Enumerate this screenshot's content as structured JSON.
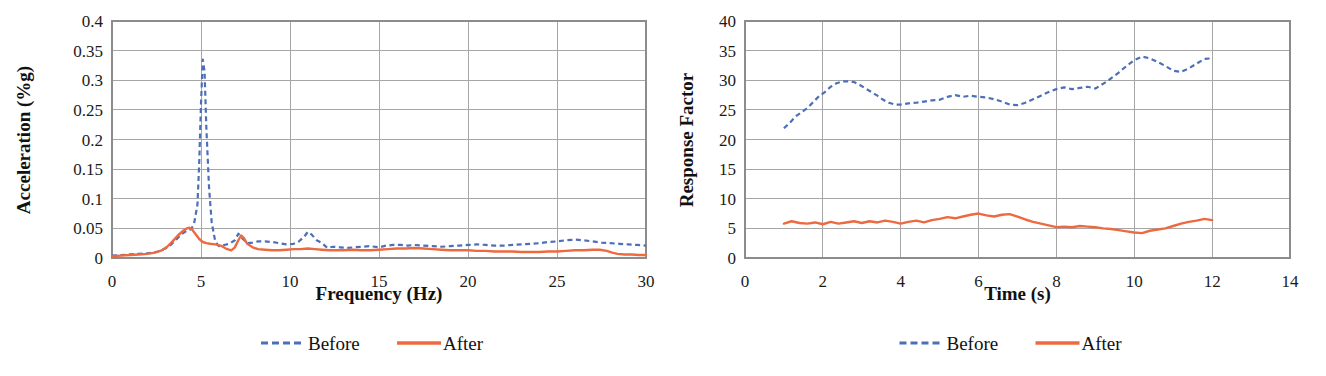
{
  "figure": {
    "panels": [
      "left",
      "right"
    ],
    "background": "#ffffff",
    "legend_common": {
      "before_label": "Before",
      "after_label": "After",
      "before_color": "#4d6fb8",
      "after_color": "#ed6a41",
      "before_style": "dashed",
      "after_style": "solid"
    }
  },
  "chart_data": [
    {
      "id": "left",
      "type": "line",
      "title": "",
      "xlabel": "Frequency (Hz)",
      "ylabel": "Acceleration (%g)",
      "xlim": [
        0,
        30
      ],
      "ylim": [
        0,
        0.4
      ],
      "xticks": [
        0,
        5,
        10,
        15,
        20,
        25,
        30
      ],
      "xtick_labels": [
        "0",
        "5",
        "10",
        "15",
        "20",
        "25",
        "30"
      ],
      "yticks": [
        0,
        0.05,
        0.1,
        0.15,
        0.2,
        0.25,
        0.3,
        0.35,
        0.4
      ],
      "ytick_labels": [
        "0",
        "0.05",
        "0.1",
        "0.15",
        "0.2",
        "0.25",
        "0.3",
        "0.35",
        "0.4"
      ],
      "grid": "horizontal-and-vertical",
      "legend_position": "below",
      "series": [
        {
          "name": "Before",
          "color": "#4d6fb8",
          "style": "dashed",
          "x": [
            0.0,
            0.5,
            1.0,
            1.5,
            2.0,
            2.3,
            2.6,
            3.0,
            3.3,
            3.6,
            3.9,
            4.2,
            4.4,
            4.6,
            4.8,
            4.9,
            5.0,
            5.1,
            5.2,
            5.3,
            5.45,
            5.6,
            5.8,
            6.0,
            6.3,
            6.6,
            6.9,
            7.1,
            7.3,
            7.6,
            7.9,
            8.2,
            8.6,
            9.0,
            9.4,
            9.8,
            10.2,
            10.5,
            10.8,
            11.0,
            11.2,
            11.5,
            11.8,
            12.1,
            12.4,
            12.8,
            13.2,
            13.6,
            14.0,
            14.5,
            15.0,
            15.4,
            15.8,
            16.2,
            16.6,
            17.0,
            17.5,
            18.0,
            18.5,
            19.0,
            19.5,
            20.0,
            20.5,
            21.0,
            21.5,
            22.0,
            22.5,
            23.0,
            23.5,
            24.0,
            24.5,
            25.0,
            25.5,
            26.0,
            26.5,
            27.0,
            27.5,
            28.0,
            28.5,
            29.0,
            29.5,
            30.0
          ],
          "y": [
            0.004,
            0.005,
            0.006,
            0.007,
            0.008,
            0.009,
            0.011,
            0.016,
            0.022,
            0.031,
            0.04,
            0.046,
            0.048,
            0.056,
            0.09,
            0.16,
            0.26,
            0.335,
            0.315,
            0.22,
            0.12,
            0.06,
            0.028,
            0.02,
            0.022,
            0.024,
            0.03,
            0.041,
            0.034,
            0.025,
            0.026,
            0.028,
            0.028,
            0.027,
            0.025,
            0.023,
            0.024,
            0.028,
            0.036,
            0.044,
            0.04,
            0.03,
            0.025,
            0.017,
            0.019,
            0.018,
            0.017,
            0.018,
            0.019,
            0.02,
            0.018,
            0.021,
            0.022,
            0.022,
            0.021,
            0.022,
            0.021,
            0.02,
            0.019,
            0.02,
            0.021,
            0.022,
            0.023,
            0.022,
            0.021,
            0.021,
            0.022,
            0.023,
            0.024,
            0.025,
            0.027,
            0.028,
            0.03,
            0.031,
            0.03,
            0.028,
            0.026,
            0.025,
            0.024,
            0.023,
            0.022,
            0.021
          ]
        },
        {
          "name": "After",
          "color": "#ed6a41",
          "style": "solid",
          "x": [
            0.0,
            0.5,
            1.0,
            1.5,
            2.0,
            2.4,
            2.8,
            3.1,
            3.4,
            3.7,
            4.0,
            4.2,
            4.35,
            4.5,
            4.7,
            4.9,
            5.1,
            5.3,
            5.5,
            5.8,
            6.1,
            6.4,
            6.7,
            6.9,
            7.1,
            7.25,
            7.4,
            7.6,
            7.9,
            8.2,
            8.6,
            9.0,
            9.4,
            9.8,
            10.2,
            10.6,
            11.0,
            11.4,
            11.8,
            12.2,
            12.6,
            13.0,
            13.5,
            14.0,
            14.5,
            15.0,
            15.5,
            16.0,
            16.5,
            17.0,
            17.5,
            18.0,
            18.5,
            19.0,
            19.5,
            20.0,
            20.5,
            21.0,
            21.5,
            22.0,
            22.5,
            23.0,
            23.5,
            24.0,
            24.5,
            25.0,
            25.5,
            26.0,
            26.5,
            27.0,
            27.4,
            27.8,
            28.1,
            28.4,
            28.8,
            29.2,
            29.6,
            30.0
          ],
          "y": [
            0.003,
            0.004,
            0.005,
            0.006,
            0.007,
            0.009,
            0.013,
            0.019,
            0.028,
            0.038,
            0.046,
            0.05,
            0.051,
            0.048,
            0.04,
            0.032,
            0.027,
            0.025,
            0.024,
            0.023,
            0.021,
            0.016,
            0.013,
            0.018,
            0.03,
            0.038,
            0.034,
            0.024,
            0.018,
            0.015,
            0.014,
            0.013,
            0.013,
            0.014,
            0.015,
            0.015,
            0.016,
            0.015,
            0.014,
            0.013,
            0.013,
            0.013,
            0.014,
            0.013,
            0.013,
            0.014,
            0.015,
            0.016,
            0.016,
            0.017,
            0.016,
            0.015,
            0.014,
            0.013,
            0.013,
            0.013,
            0.012,
            0.012,
            0.011,
            0.011,
            0.011,
            0.01,
            0.01,
            0.01,
            0.011,
            0.011,
            0.012,
            0.013,
            0.013,
            0.014,
            0.014,
            0.012,
            0.009,
            0.007,
            0.006,
            0.006,
            0.005,
            0.005
          ]
        }
      ]
    },
    {
      "id": "right",
      "type": "line",
      "title": "",
      "xlabel": "Time (s)",
      "ylabel": "Response Factor",
      "xlim": [
        0,
        14
      ],
      "ylim": [
        0,
        40
      ],
      "xticks": [
        0,
        2,
        4,
        6,
        8,
        10,
        12,
        14
      ],
      "xtick_labels": [
        "0",
        "2",
        "4",
        "6",
        "8",
        "10",
        "12",
        "14"
      ],
      "yticks": [
        0,
        5,
        10,
        15,
        20,
        25,
        30,
        35,
        40
      ],
      "ytick_labels": [
        "0",
        "5",
        "10",
        "15",
        "20",
        "25",
        "30",
        "35",
        "40"
      ],
      "grid": "horizontal-and-vertical",
      "legend_position": "below",
      "series": [
        {
          "name": "Before",
          "color": "#4d6fb8",
          "style": "dashed",
          "x": [
            1.0,
            1.15,
            1.3,
            1.45,
            1.6,
            1.75,
            1.9,
            2.05,
            2.2,
            2.35,
            2.5,
            2.65,
            2.8,
            2.95,
            3.1,
            3.25,
            3.4,
            3.55,
            3.7,
            3.85,
            4.0,
            4.2,
            4.4,
            4.6,
            4.8,
            5.0,
            5.2,
            5.4,
            5.6,
            5.8,
            6.0,
            6.2,
            6.4,
            6.6,
            6.8,
            7.0,
            7.2,
            7.4,
            7.6,
            7.8,
            8.0,
            8.2,
            8.4,
            8.6,
            8.8,
            9.0,
            9.2,
            9.4,
            9.6,
            9.8,
            10.0,
            10.2,
            10.4,
            10.6,
            10.8,
            11.0,
            11.2,
            11.4,
            11.6,
            11.8,
            12.0
          ],
          "y": [
            21.9,
            22.8,
            23.9,
            24.6,
            25.3,
            26.3,
            27.3,
            28.0,
            28.9,
            29.5,
            29.8,
            29.8,
            29.7,
            29.2,
            28.6,
            28.0,
            27.4,
            26.7,
            26.2,
            25.9,
            25.9,
            26.1,
            26.2,
            26.4,
            26.6,
            26.7,
            27.2,
            27.5,
            27.2,
            27.4,
            27.2,
            27.1,
            26.8,
            26.4,
            25.9,
            25.8,
            26.2,
            26.8,
            27.4,
            28.0,
            28.5,
            28.8,
            28.5,
            28.7,
            28.9,
            28.6,
            29.4,
            30.3,
            31.3,
            32.4,
            33.4,
            34.0,
            33.7,
            33.1,
            32.4,
            31.6,
            31.4,
            32.0,
            32.8,
            33.6,
            33.7
          ]
        },
        {
          "name": "After",
          "color": "#ed6a41",
          "style": "solid",
          "x": [
            1.0,
            1.2,
            1.4,
            1.6,
            1.8,
            2.0,
            2.2,
            2.4,
            2.6,
            2.8,
            3.0,
            3.2,
            3.4,
            3.6,
            3.8,
            4.0,
            4.2,
            4.4,
            4.6,
            4.8,
            5.0,
            5.2,
            5.4,
            5.6,
            5.8,
            6.0,
            6.2,
            6.4,
            6.6,
            6.8,
            7.0,
            7.2,
            7.4,
            7.6,
            7.8,
            8.0,
            8.2,
            8.4,
            8.6,
            8.8,
            9.0,
            9.2,
            9.4,
            9.6,
            9.8,
            10.0,
            10.2,
            10.4,
            10.6,
            10.8,
            11.0,
            11.2,
            11.4,
            11.6,
            11.8,
            12.0
          ],
          "y": [
            5.8,
            6.2,
            5.9,
            5.8,
            6.0,
            5.7,
            6.1,
            5.8,
            6.0,
            6.2,
            5.9,
            6.2,
            6.0,
            6.3,
            6.1,
            5.8,
            6.1,
            6.3,
            6.0,
            6.4,
            6.6,
            6.9,
            6.7,
            7.0,
            7.3,
            7.5,
            7.2,
            7.0,
            7.3,
            7.4,
            7.0,
            6.5,
            6.1,
            5.8,
            5.5,
            5.2,
            5.3,
            5.2,
            5.4,
            5.3,
            5.2,
            5.0,
            4.9,
            4.7,
            4.5,
            4.3,
            4.2,
            4.6,
            4.8,
            5.0,
            5.4,
            5.8,
            6.1,
            6.3,
            6.6,
            6.4
          ]
        }
      ]
    }
  ]
}
